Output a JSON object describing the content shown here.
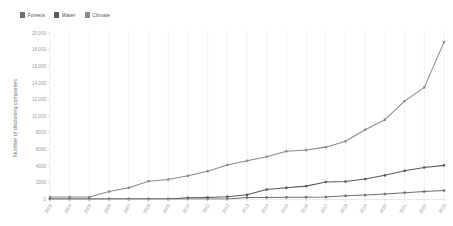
{
  "legend": {
    "position": "top-left",
    "items": [
      {
        "label": "Forests",
        "color": "#6e6e6e"
      },
      {
        "label": "Water",
        "color": "#5a5a5a"
      },
      {
        "label": "Climate",
        "color": "#8a8a8a"
      }
    ]
  },
  "axes": {
    "ylabel": "Number of disclosing companies",
    "xlabel": "",
    "yticks": [
      "0",
      "2000",
      "4000",
      "6000",
      "8000",
      "10,000",
      "12,000",
      "14,000",
      "16,000",
      "18,000",
      "20,000"
    ],
    "xticks": [
      "2003",
      "2004",
      "2005",
      "2006",
      "2007",
      "2008",
      "2009",
      "2010",
      "2011",
      "2012",
      "2013",
      "2014",
      "2015",
      "2016",
      "2017",
      "2018",
      "2019",
      "2020",
      "2021",
      "2022",
      "2023"
    ]
  },
  "chart_data": {
    "type": "line",
    "title": "",
    "subtitle": "",
    "xlabel": "",
    "ylabel": "Number of disclosing companies",
    "grid": "vertical",
    "legend_position": "top-left",
    "ylim": [
      0,
      20000
    ],
    "ytick_step": 2000,
    "categories": [
      "2003",
      "2004",
      "2005",
      "2006",
      "2007",
      "2008",
      "2009",
      "2010",
      "2011",
      "2012",
      "2013",
      "2014",
      "2015",
      "2016",
      "2017",
      "2018",
      "2019",
      "2020",
      "2021",
      "2022",
      "2023"
    ],
    "series": [
      {
        "name": "Climate",
        "color": "#8a8a8a",
        "values": [
          230,
          250,
          230,
          900,
          1350,
          2150,
          2350,
          2800,
          3350,
          4100,
          4600,
          5100,
          5750,
          5900,
          6250,
          6950,
          8350,
          9550,
          11800,
          13450,
          18900
        ]
      },
      {
        "name": "Water",
        "color": "#5a5a5a",
        "values": [
          0,
          0,
          0,
          0,
          0,
          0,
          0,
          150,
          190,
          280,
          500,
          1150,
          1350,
          1550,
          2050,
          2100,
          2400,
          2850,
          3400,
          3800,
          4050
        ]
      },
      {
        "name": "Forests",
        "color": "#6e6e6e",
        "values": [
          0,
          0,
          0,
          0,
          0,
          0,
          0,
          0,
          0,
          0,
          180,
          190,
          200,
          210,
          240,
          380,
          470,
          600,
          760,
          900,
          1020
        ]
      }
    ]
  }
}
